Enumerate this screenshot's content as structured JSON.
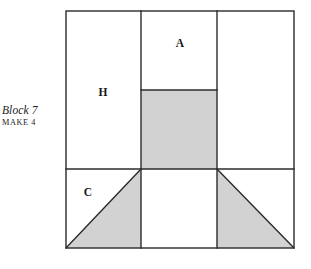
{
  "figure": {
    "kind": "quilt-block-piecing-diagram",
    "caption": {
      "title": "Block 7",
      "subtitle": "MAKE 4"
    },
    "colors": {
      "line": "#2b2b2b",
      "fabric_shaded": "#d2d2d2",
      "fabric_plain": "#ffffff",
      "background": "#ffffff",
      "label_text": "#171717"
    },
    "geometry": {
      "outer_square": {
        "x": 66,
        "y": 11,
        "width": 228,
        "height": 237
      },
      "vertical_dividers_x": [
        141,
        217
      ],
      "horizontal_divider_y": 169,
      "center_rect_top_y": 90,
      "stroke_width": 1.4
    },
    "labels": [
      {
        "id": "piece-a",
        "text": "A",
        "x": 180,
        "y": 44
      },
      {
        "id": "piece-h",
        "text": "H",
        "x": 103,
        "y": 93
      },
      {
        "id": "piece-c",
        "text": "C",
        "x": 88,
        "y": 193
      }
    ],
    "pieces": {
      "top_left_rect": {
        "name": "H",
        "shade": "plain"
      },
      "top_center_rect": {
        "name": "A",
        "shade": "plain"
      },
      "top_right_rect": {
        "name": "",
        "shade": "plain"
      },
      "center_rect": {
        "name": "",
        "shade": "shaded"
      },
      "bottom_left_triangle": {
        "name": "C",
        "shade": "shaded"
      },
      "bottom_center_rect": {
        "name": "",
        "shade": "plain"
      },
      "bottom_right_triangle": {
        "name": "",
        "shade": "shaded"
      }
    }
  }
}
